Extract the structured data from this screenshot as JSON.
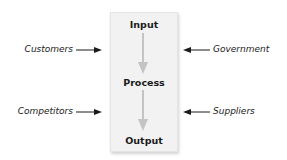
{
  "diagram": {
    "type": "process-flow",
    "stages": [
      "Input",
      "Process",
      "Output"
    ],
    "left_influences": [
      "Customers",
      "Competitors"
    ],
    "right_influences": [
      "Government",
      "Suppliers"
    ],
    "colors": {
      "box_fill": "#f2f2f2",
      "flow_arrow": "#c4c4c4",
      "influence_arrow": "#1a1a1a",
      "text": "#1a1a1a"
    }
  }
}
